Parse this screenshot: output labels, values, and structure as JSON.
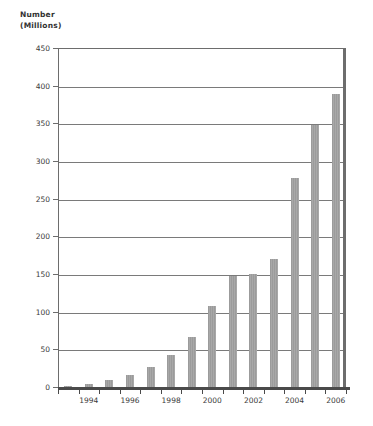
{
  "chart_data": {
    "type": "bar",
    "xlabel": "",
    "ylabel": "Number (Millions)",
    "ylim": [
      0,
      450
    ],
    "ytick_step": 50,
    "yticks": [
      0,
      50,
      100,
      150,
      200,
      250,
      300,
      350,
      400,
      450
    ],
    "grid": true,
    "legend": "none",
    "categories": [
      "1993",
      "1994",
      "1995",
      "1996",
      "1997",
      "1998",
      "1999",
      "2000",
      "2001",
      "2002",
      "2003",
      "2004",
      "2005",
      "2006"
    ],
    "xtick_labels": [
      "1994",
      "1996",
      "1998",
      "2000",
      "2002",
      "2004",
      "2006"
    ],
    "values": [
      2,
      4,
      9,
      16,
      26,
      42,
      67,
      107,
      147,
      150,
      170,
      278,
      348,
      389
    ],
    "bar_color": "#9e9e9e",
    "axis_color": "#6d6d6d"
  },
  "axis": {
    "title_line1": "Number",
    "title_line2": "(Millions)"
  }
}
